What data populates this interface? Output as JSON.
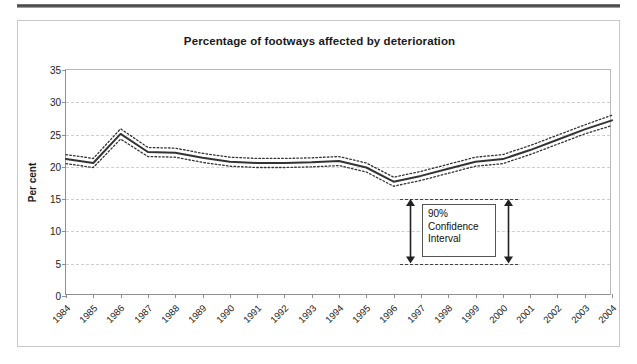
{
  "figure": {
    "title": "Percentage of footways affected by deterioration"
  },
  "annotation": {
    "line1": "90%",
    "line2": "Confidence",
    "line3": "Interval",
    "top_value": 15,
    "bottom_value": 5
  },
  "chart_data": {
    "type": "line",
    "title": "Percentage of footways affected by deterioration",
    "xlabel": "",
    "ylabel": "Per cent",
    "ylim": [
      0,
      35
    ],
    "ytick_values": [
      0,
      5,
      10,
      15,
      20,
      25,
      30,
      35
    ],
    "ytick_labels": [
      "0",
      "5",
      "10",
      "15",
      "20",
      "25",
      "30",
      "35"
    ],
    "grid": true,
    "legend_position": "none",
    "categories": [
      "1984",
      "1985",
      "1986",
      "1987",
      "1988",
      "1989",
      "1990",
      "1991",
      "1992",
      "1993",
      "1994",
      "1995",
      "1996",
      "1997",
      "1998",
      "1999",
      "2000",
      "2001",
      "2002",
      "2003",
      "2004"
    ],
    "series": [
      {
        "name": "Central estimate",
        "style": "solid",
        "color": "#333333",
        "values": [
          21.2,
          20.6,
          25.1,
          22.3,
          22.2,
          21.4,
          20.8,
          20.6,
          20.6,
          20.7,
          20.9,
          19.9,
          17.7,
          18.6,
          19.7,
          20.8,
          21.2,
          22.6,
          24.2,
          25.8,
          27.2
        ]
      },
      {
        "name": "90% confidence interval upper",
        "style": "dotted",
        "color": "#333333",
        "values": [
          21.9,
          21.3,
          25.9,
          23.0,
          22.9,
          22.1,
          21.5,
          21.3,
          21.3,
          21.4,
          21.6,
          20.6,
          18.4,
          19.3,
          20.4,
          21.5,
          21.9,
          23.3,
          24.9,
          26.5,
          28.0
        ]
      },
      {
        "name": "90% confidence interval lower",
        "style": "dotted",
        "color": "#333333",
        "values": [
          20.5,
          19.9,
          24.3,
          21.6,
          21.5,
          20.7,
          20.1,
          19.9,
          19.9,
          20.0,
          20.2,
          19.2,
          17.0,
          17.9,
          19.0,
          20.1,
          20.5,
          21.9,
          23.5,
          25.1,
          26.4
        ]
      }
    ],
    "annotations": [
      {
        "text": "90% Confidence Interval",
        "y_top": 15,
        "y_bottom": 5,
        "x_category": "1999"
      }
    ]
  }
}
